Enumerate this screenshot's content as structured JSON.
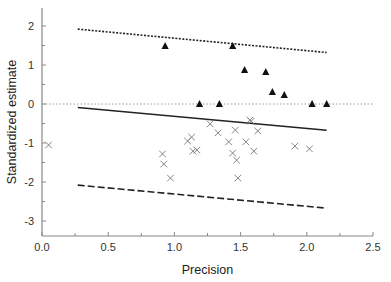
{
  "chart_data": {
    "type": "scatter",
    "title": "",
    "xlabel": "Precision",
    "ylabel": "Standardized estimate",
    "xlim": [
      0.0,
      2.5
    ],
    "ylim": [
      -3.4,
      2.45
    ],
    "xticks": [
      0.0,
      0.5,
      1.0,
      1.5,
      2.0,
      2.5
    ],
    "xtick_labels": [
      "0.0",
      "0.5",
      "1.0",
      "1.5",
      "2.0",
      "2.5"
    ],
    "yticks": [
      2,
      1,
      0,
      -1,
      -2,
      -3
    ],
    "ytick_labels": [
      "2",
      "1",
      "0",
      "-1",
      "-2",
      "-3"
    ],
    "grid": false,
    "legend": null,
    "series": [
      {
        "name": "triangles",
        "marker": "filled-triangle",
        "color": "#111111",
        "points": [
          [
            0.93,
            1.49
          ],
          [
            1.44,
            1.49
          ],
          [
            1.53,
            0.87
          ],
          [
            1.69,
            0.82
          ],
          [
            1.74,
            0.31
          ],
          [
            1.83,
            0.23
          ],
          [
            1.19,
            0.0
          ],
          [
            1.34,
            0.0
          ],
          [
            2.04,
            0.0
          ],
          [
            2.15,
            0.0
          ]
        ]
      },
      {
        "name": "crosses",
        "marker": "x",
        "color": "#777777",
        "points": [
          [
            0.05,
            -1.05
          ],
          [
            0.91,
            -1.28
          ],
          [
            0.92,
            -1.54
          ],
          [
            0.97,
            -1.9
          ],
          [
            1.1,
            -0.95
          ],
          [
            1.13,
            -0.85
          ],
          [
            1.14,
            -1.21
          ],
          [
            1.17,
            -1.18
          ],
          [
            1.27,
            -0.51
          ],
          [
            1.33,
            -0.74
          ],
          [
            1.41,
            -0.97
          ],
          [
            1.44,
            -1.26
          ],
          [
            1.46,
            -0.67
          ],
          [
            1.47,
            -1.44
          ],
          [
            1.48,
            -1.9
          ],
          [
            1.54,
            -0.97
          ],
          [
            1.57,
            -0.41
          ],
          [
            1.58,
            -0.44
          ],
          [
            1.6,
            -1.21
          ],
          [
            1.63,
            -0.69
          ],
          [
            1.91,
            -1.08
          ],
          [
            2.02,
            -1.15
          ]
        ]
      }
    ],
    "lines": [
      {
        "name": "upper-bound",
        "style": "dotted-dense",
        "x": [
          0.27,
          2.15
        ],
        "y": [
          1.92,
          1.32
        ]
      },
      {
        "name": "regression",
        "style": "solid",
        "x": [
          0.27,
          2.15
        ],
        "y": [
          -0.09,
          -0.67
        ]
      },
      {
        "name": "lower-bound",
        "style": "dashed",
        "x": [
          0.27,
          2.15
        ],
        "y": [
          -2.08,
          -2.67
        ]
      },
      {
        "name": "zero-reference",
        "style": "dotted-light",
        "x": [
          0.0,
          2.5
        ],
        "y": [
          0.0,
          0.0
        ]
      }
    ]
  }
}
